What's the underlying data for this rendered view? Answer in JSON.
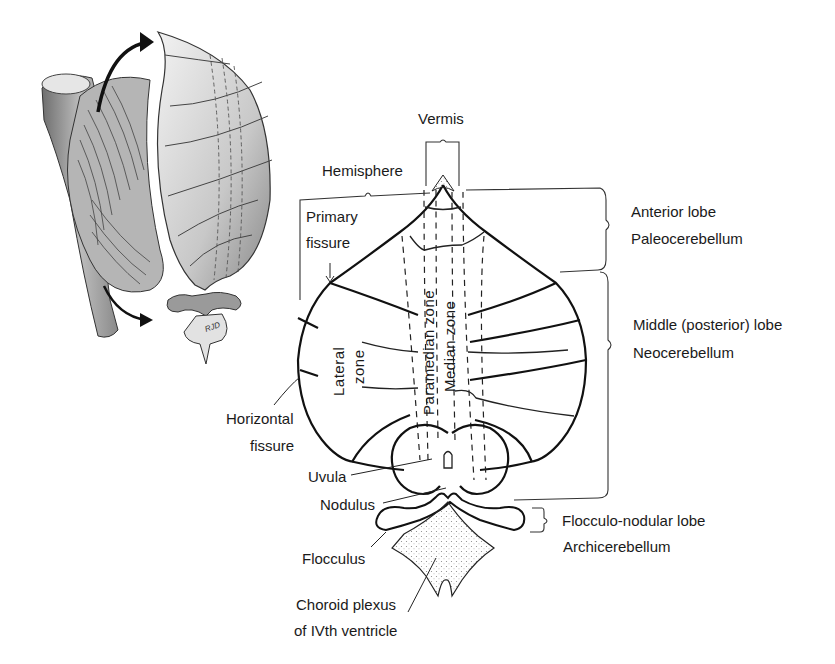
{
  "figure": {
    "inset": {
      "description": "3D sketch of brainstem and cerebellum with arrows indicating unfolding",
      "signature": "RJD"
    },
    "labels": {
      "vermis": "Vermis",
      "hemisphere": "Hemisphere",
      "primary_fissure_line1": "Primary",
      "primary_fissure_line2": "fissure",
      "lateral_zone_line1": "Lateral",
      "lateral_zone_line2": "zone",
      "paramedian_zone": "Paramedian zone",
      "median_zone": "Median zone",
      "horizontal_fissure_line1": "Horizontal",
      "horizontal_fissure_line2": "fissure",
      "uvula": "Uvula",
      "nodulus": "Nodulus",
      "flocculus": "Flocculus",
      "choroid_plexus_line1": "Choroid plexus",
      "choroid_plexus_line2": "of IVth ventricle"
    },
    "lobes": [
      {
        "name": "Anterior lobe",
        "alt_name": "Paleocerebellum"
      },
      {
        "name": "Middle (posterior) lobe",
        "alt_name": "Neocerebellum"
      },
      {
        "name": "Flocculo-nodular lobe",
        "alt_name": "Archicerebellum"
      }
    ],
    "colors": {
      "ink": "#111111",
      "background": "#ffffff",
      "shading": "#9a9a9a"
    }
  }
}
